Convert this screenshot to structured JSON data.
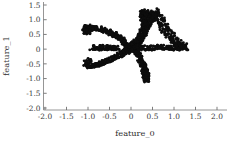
{
  "figure": {
    "background_color": "#ffffff",
    "marker_color": "#0d0d0d",
    "axis_color": "#8a8a8a"
  },
  "axes": {
    "xlabel": "feature_0",
    "ylabel": "feature_1",
    "x_ticks": [
      "-2.0",
      "-1.5",
      "-1.0",
      "-0.5",
      "0",
      "0.5",
      "1.0",
      "1.5",
      "2.0"
    ],
    "y_ticks": [
      "1.5",
      "1.0",
      "0.5",
      "0",
      "-0.5",
      "-1.0",
      "-1.5",
      "-2.0"
    ]
  },
  "chart_data": {
    "type": "scatter",
    "title": "",
    "xlabel": "feature_0",
    "ylabel": "feature_1",
    "xlim": [
      -2.15,
      2.3
    ],
    "ylim": [
      -2.2,
      1.75
    ],
    "xticks": [
      -2.0,
      -1.5,
      -1.0,
      -0.5,
      0,
      0.5,
      1.0,
      1.5,
      2.0
    ],
    "yticks": [
      1.5,
      1.0,
      0.5,
      0,
      -0.5,
      -1.0,
      -1.5,
      -2.0
    ],
    "grid": false,
    "legend": null,
    "marker": {
      "shape": "o",
      "color": "#0d0d0d",
      "size": 1.6
    },
    "series": [
      {
        "name": "samples",
        "description": "six-armed star / flower shaped point cloud centred near the origin",
        "x": [
          0.03,
          -0.01,
          0.06,
          0.1,
          -0.04,
          0.0,
          0.08,
          0.02,
          -0.06,
          0.12,
          0.05,
          -0.02,
          0.09,
          0.01,
          -0.08,
          0.14,
          0.04,
          -0.03,
          0.07,
          0.11,
          0.0,
          0.06,
          -0.05,
          0.13,
          0.03,
          0.16,
          0.18,
          0.1,
          0.21,
          0.08,
          0.24,
          0.14,
          0.27,
          0.19,
          0.3,
          0.22,
          0.33,
          0.25,
          0.36,
          0.28,
          0.38,
          0.31,
          0.41,
          0.34,
          0.44,
          0.36,
          0.47,
          0.39,
          0.5,
          0.42,
          0.52,
          0.45,
          0.56,
          0.48,
          0.6,
          0.51,
          0.64,
          0.55,
          0.68,
          0.58,
          0.72,
          0.62,
          0.76,
          0.66,
          0.8,
          0.7,
          0.85,
          0.74,
          0.9,
          0.79,
          0.95,
          0.84,
          1.0,
          0.89,
          1.05,
          0.94,
          1.1,
          0.99,
          1.15,
          1.04,
          1.2,
          1.09,
          1.25,
          1.14,
          1.28,
          1.19,
          1.3,
          1.23,
          1.27,
          1.17,
          0.14,
          0.18,
          0.17,
          0.21,
          0.2,
          0.24,
          0.23,
          0.27,
          0.26,
          0.3,
          0.28,
          0.32,
          0.3,
          0.34,
          0.32,
          0.36,
          0.33,
          0.37,
          0.34,
          0.38,
          0.35,
          0.39,
          0.36,
          0.4,
          0.37,
          0.41,
          0.36,
          0.4,
          0.35,
          0.39,
          0.34,
          0.38,
          0.33,
          0.37,
          0.32,
          0.36,
          0.31,
          0.35,
          0.3,
          0.34,
          -0.05,
          -0.09,
          -0.08,
          -0.12,
          -0.11,
          -0.15,
          -0.14,
          -0.18,
          -0.17,
          -0.21,
          -0.22,
          -0.26,
          -0.27,
          -0.31,
          -0.32,
          -0.36,
          -0.38,
          -0.42,
          -0.44,
          -0.48,
          -0.5,
          -0.54,
          -0.57,
          -0.61,
          -0.64,
          -0.68,
          -0.71,
          -0.75,
          -0.78,
          -0.82,
          -0.85,
          -0.89,
          -0.92,
          -0.95,
          -0.98,
          -1.0,
          -1.02,
          -1.04,
          -1.05,
          -1.03,
          -0.06,
          -0.1,
          -0.09,
          -0.13,
          -0.12,
          -0.16,
          -0.15,
          -0.19,
          -0.18,
          -0.22,
          -0.24,
          -0.28,
          -0.3,
          -0.34,
          -0.36,
          -0.4,
          -0.42,
          -0.46,
          -0.48,
          -0.52,
          -0.55,
          -0.59,
          -0.62,
          -0.66,
          -0.69,
          -0.73,
          -0.76,
          -0.8,
          -0.83,
          -0.87,
          -0.9,
          -0.93,
          -0.96,
          -0.98,
          -1.0,
          -1.01,
          -1.02,
          -1.0,
          -0.97,
          -0.94,
          0.07,
          0.11,
          0.1,
          0.14,
          0.13,
          0.17,
          0.16,
          0.2,
          0.19,
          0.23,
          0.22,
          0.26,
          0.25,
          0.29,
          0.28,
          0.31,
          0.3,
          0.33,
          0.31,
          0.34,
          0.32,
          0.35,
          0.33,
          0.36,
          0.34,
          0.37,
          0.33,
          0.36,
          0.32,
          0.35,
          0.31,
          0.34,
          0.3,
          0.33,
          0.29,
          0.32,
          0.28,
          0.31,
          0.27,
          0.3,
          0.2,
          0.26,
          0.31,
          0.36,
          0.41,
          0.46,
          0.52,
          0.57,
          0.62,
          0.67,
          0.72,
          0.77,
          0.82,
          0.86,
          0.9,
          0.94,
          0.98,
          1.02,
          1.06,
          1.1,
          -0.3,
          -0.34,
          -0.37,
          -0.4,
          -0.43,
          -0.46,
          -0.49,
          -0.52,
          -0.55,
          -0.58,
          -0.61,
          -0.64,
          -0.67,
          -0.7,
          -0.73,
          -0.76,
          -0.79,
          -0.82,
          -0.85,
          -0.88,
          0.36,
          0.37,
          0.38,
          0.39,
          0.4,
          0.41,
          0.39,
          0.37,
          0.35,
          0.33,
          -0.96,
          -0.99,
          -1.01,
          -1.03,
          -1.04,
          -1.02,
          -0.99,
          -0.96,
          -0.93,
          -0.9
        ],
        "y": [
          0.02,
          -0.02,
          0.05,
          -0.05,
          0.01,
          0.08,
          -0.08,
          0.04,
          -0.04,
          0.0,
          0.1,
          -0.1,
          0.06,
          -0.06,
          0.02,
          0.03,
          -0.03,
          0.09,
          -0.09,
          0.05,
          -0.01,
          0.12,
          -0.12,
          0.07,
          -0.07,
          0.02,
          0.1,
          0.14,
          0.16,
          0.18,
          0.22,
          0.26,
          0.3,
          0.34,
          0.38,
          0.42,
          0.46,
          0.5,
          0.54,
          0.58,
          0.62,
          0.66,
          0.7,
          0.74,
          0.78,
          0.82,
          0.86,
          0.9,
          0.94,
          0.98,
          1.02,
          1.06,
          1.1,
          1.14,
          1.18,
          1.22,
          1.25,
          1.2,
          1.15,
          1.1,
          1.05,
          1.0,
          0.95,
          0.9,
          0.85,
          0.8,
          0.75,
          0.7,
          0.65,
          0.6,
          0.55,
          0.5,
          0.45,
          0.4,
          0.35,
          0.3,
          0.26,
          0.22,
          0.18,
          0.15,
          0.12,
          0.09,
          0.06,
          0.04,
          0.02,
          0.0,
          -0.02,
          0.05,
          0.08,
          0.11,
          -0.14,
          -0.18,
          -0.22,
          -0.26,
          -0.3,
          -0.34,
          -0.38,
          -0.42,
          -0.46,
          -0.5,
          -0.54,
          -0.58,
          -0.62,
          -0.66,
          -0.7,
          -0.74,
          -0.78,
          -0.82,
          -0.86,
          -0.9,
          -0.94,
          -0.98,
          -1.02,
          -1.06,
          -1.08,
          -1.1,
          -1.07,
          -1.03,
          -0.99,
          -0.95,
          -0.91,
          -0.87,
          -0.83,
          -0.79,
          -0.75,
          -0.71,
          -0.67,
          -0.63,
          -0.59,
          -0.55,
          0.06,
          0.09,
          0.12,
          0.15,
          0.18,
          0.21,
          0.24,
          0.27,
          0.3,
          0.33,
          0.35,
          0.37,
          0.39,
          0.41,
          0.43,
          0.45,
          0.47,
          0.49,
          0.51,
          0.53,
          0.55,
          0.57,
          0.59,
          0.61,
          0.62,
          0.63,
          0.64,
          0.65,
          0.66,
          0.67,
          0.68,
          0.69,
          0.7,
          0.7,
          0.69,
          0.67,
          0.64,
          0.6,
          0.56,
          0.52,
          -0.04,
          -0.07,
          -0.09,
          -0.11,
          -0.13,
          -0.15,
          -0.17,
          -0.19,
          -0.21,
          -0.23,
          -0.25,
          -0.27,
          -0.29,
          -0.31,
          -0.33,
          -0.35,
          -0.37,
          -0.39,
          -0.41,
          -0.43,
          -0.45,
          -0.47,
          -0.49,
          -0.51,
          -0.53,
          -0.55,
          -0.57,
          -0.58,
          -0.59,
          -0.6,
          -0.61,
          -0.62,
          -0.62,
          -0.61,
          -0.59,
          -0.56,
          -0.52,
          -0.48,
          -0.45,
          -0.42,
          0.04,
          0.07,
          0.1,
          0.13,
          0.16,
          0.19,
          0.22,
          0.25,
          0.28,
          0.31,
          0.34,
          0.37,
          0.4,
          0.43,
          0.46,
          0.49,
          0.52,
          0.55,
          0.58,
          0.61,
          0.64,
          0.67,
          0.7,
          0.73,
          0.76,
          0.79,
          0.82,
          0.85,
          0.88,
          0.91,
          0.94,
          0.97,
          1.0,
          1.03,
          1.06,
          1.09,
          1.12,
          1.15,
          1.18,
          1.21,
          0.02,
          0.01,
          0.0,
          -0.01,
          -0.02,
          -0.01,
          0.0,
          0.01,
          0.02,
          0.03,
          0.04,
          0.03,
          0.02,
          0.01,
          0.0,
          -0.01,
          0.0,
          0.01,
          0.02,
          0.01,
          0.01,
          0.0,
          -0.01,
          0.0,
          0.01,
          0.02,
          0.01,
          0.0,
          -0.01,
          0.0,
          0.01,
          0.02,
          0.01,
          0.0,
          -0.01,
          0.0,
          0.01,
          0.02,
          0.01,
          0.0,
          1.24,
          1.22,
          1.2,
          1.18,
          1.16,
          1.14,
          1.12,
          1.1,
          1.08,
          1.06,
          0.55,
          0.58,
          0.61,
          0.64,
          0.67,
          0.69,
          0.7,
          0.69,
          0.67,
          0.64
        ]
      }
    ]
  }
}
